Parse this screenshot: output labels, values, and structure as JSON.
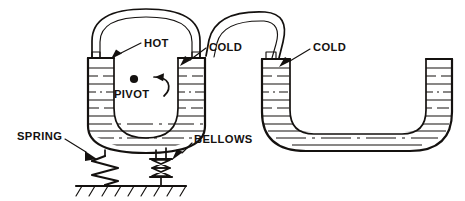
{
  "figure": {
    "domain": "technical-line-diagram",
    "background_color": "#ffffff",
    "ink_color": "#14110f",
    "width": 465,
    "height": 201
  },
  "labels": {
    "hot": "HOT",
    "cold_left": "COLD",
    "cold_right": "COLD",
    "pivot": "PIVOT",
    "spring": "SPRING",
    "bellows": "BELLOWS"
  },
  "components": {
    "left_vessel": {
      "name": "pivoting U-shaped vessel",
      "hot_leg_label": "HOT",
      "cold_leg_label": "COLD",
      "liquid_hatching": "horizontal dashed fill lines"
    },
    "right_vessel": {
      "name": "wide flat-bottom U-tube",
      "cold_leg_label": "COLD",
      "liquid_hatching": "horizontal dashed fill lines"
    },
    "connecting_tubes": [
      {
        "name": "left arch tube",
        "style": "double-line hollow pipe"
      },
      {
        "name": "right arch tube",
        "style": "double-line hollow pipe"
      }
    ],
    "pivot_point": {
      "name": "pivot",
      "marker": "filled dot",
      "rotation_arrow": "curved arrow pointing left"
    },
    "spring": {
      "name": "spring",
      "style": "zigzag",
      "anchored_to": "ground"
    },
    "bellows": {
      "name": "bellows",
      "style": "stacked bowtie segments",
      "anchored_to": "ground"
    },
    "ground": {
      "name": "ground",
      "style": "hatched baseline"
    }
  }
}
